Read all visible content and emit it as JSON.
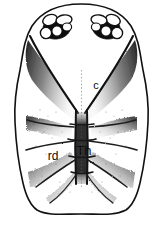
{
  "figure": {
    "kind": "scientific-line-drawing",
    "background_color": "#ffffff",
    "ink_color": "#111111",
    "stipple_color": "#2b2b2b",
    "outline_color": "#1a1a1a"
  },
  "labels": [
    {
      "id": "c",
      "text": "c",
      "x": 96,
      "y": 89,
      "font_size": 11
    },
    {
      "id": "rd",
      "text": "rd",
      "x": 44,
      "y": 160,
      "font_size": 12
    },
    {
      "id": "Th",
      "text": "Th",
      "x": 74,
      "y": 155,
      "font_size": 13
    }
  ],
  "anatomy": {
    "eye_clusters": [
      {
        "side": "left",
        "lenses": 5
      },
      {
        "side": "right",
        "lenses": 5
      }
    ],
    "median_band": "Th",
    "lateral_ridges": "rd",
    "anterior_wedge": "c"
  }
}
